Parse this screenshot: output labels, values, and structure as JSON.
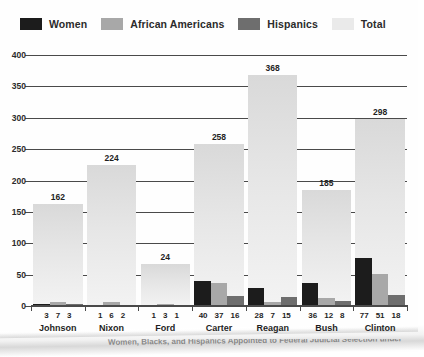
{
  "legend": {
    "items": [
      {
        "label": "Women",
        "color": "#1c1c1c"
      },
      {
        "label": "African Americans",
        "color": "#a8a8a8"
      },
      {
        "label": "Hispanics",
        "color": "#6e6e6e"
      },
      {
        "label": "Total",
        "color": "#eaeaea"
      }
    ]
  },
  "axis": {
    "y_ticks": [
      "400",
      "350",
      "300",
      "250",
      "200",
      "150",
      "100",
      "50",
      "0"
    ]
  },
  "caption": {
    "text": "Women, Blacks, and Hispanics Appointed to Federal Judicial Selection under"
  },
  "chart_data": {
    "type": "bar",
    "title": "",
    "xlabel": "",
    "ylabel": "",
    "ylim": [
      0,
      400
    ],
    "ytick_step": 50,
    "grid": true,
    "legend_position": "top-left",
    "categories": [
      "Johnson",
      "Nixon",
      "Ford",
      "Carter",
      "Reagan",
      "Bush",
      "Clinton"
    ],
    "series": [
      {
        "name": "Women",
        "color": "#1c1c1c",
        "values": [
          3,
          1,
          1,
          40,
          28,
          36,
          77
        ]
      },
      {
        "name": "African Americans",
        "color": "#a8a8a8",
        "values": [
          7,
          6,
          3,
          37,
          7,
          12,
          51
        ]
      },
      {
        "name": "Hispanics",
        "color": "#6e6e6e",
        "values": [
          3,
          2,
          1,
          16,
          15,
          8,
          18
        ]
      },
      {
        "name": "Total",
        "color": "#eaeaea",
        "values": [
          162,
          224,
          24,
          258,
          368,
          185,
          298
        ]
      }
    ],
    "total_bar_heights": [
      162,
      224,
      67,
      258,
      368,
      185,
      298
    ],
    "total_labels": [
      "162",
      "224",
      "24",
      "258",
      "368",
      "185",
      "298"
    ]
  }
}
